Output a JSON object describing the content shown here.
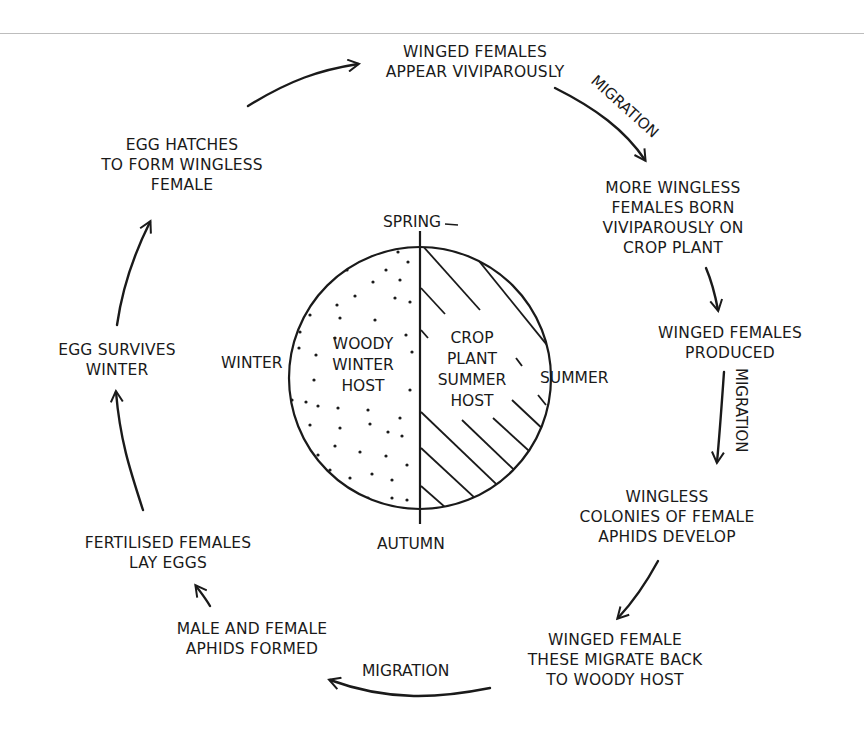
{
  "colors": {
    "ink": "#1a1a1a",
    "background": "#ffffff",
    "top_rule": "#bdbdbd"
  },
  "center_disc": {
    "left_half": {
      "label_lines": [
        "WOODY",
        "WINTER",
        "HOST"
      ],
      "fill": "dotted"
    },
    "right_half": {
      "label_lines": [
        "CROP",
        "PLANT",
        "SUMMER",
        "HOST"
      ],
      "fill": "hatched"
    },
    "seasons": {
      "top": "SPRING",
      "right": "SUMMER",
      "bottom": "AUTUMN",
      "left": "WINTER"
    }
  },
  "stages": [
    {
      "id": "winged-females-appear",
      "lines": [
        "WINGED FEMALES",
        "APPEAR VIVIPAROUSLY"
      ]
    },
    {
      "id": "more-wingless-females",
      "lines": [
        "MORE WINGLESS",
        "FEMALES BORN",
        "VIVIPAROUSLY ON",
        "CROP PLANT"
      ]
    },
    {
      "id": "winged-females-produced",
      "lines": [
        "WINGED FEMALES",
        "PRODUCED"
      ]
    },
    {
      "id": "wingless-colonies",
      "lines": [
        "WINGLESS",
        "COLONIES OF FEMALE",
        "APHIDS DEVELOP"
      ]
    },
    {
      "id": "winged-female-migrate-back",
      "lines": [
        "WINGED FEMALE",
        "THESE MIGRATE BACK",
        "TO WOODY HOST"
      ]
    },
    {
      "id": "male-female-formed",
      "lines": [
        "MALE AND FEMALE",
        "APHIDS FORMED"
      ]
    },
    {
      "id": "fertilised-lay-eggs",
      "lines": [
        "FERTILISED FEMALES",
        "LAY EGGS"
      ]
    },
    {
      "id": "egg-survives-winter",
      "lines": [
        "EGG SURVIVES",
        "WINTER"
      ]
    },
    {
      "id": "egg-hatches",
      "lines": [
        "EGG HATCHES",
        "TO FORM WINGLESS",
        "FEMALE"
      ]
    }
  ],
  "arrow_labels": {
    "migration_top_right": "MIGRATION",
    "migration_right": "MIGRATION",
    "migration_bottom": "MIGRATION"
  }
}
